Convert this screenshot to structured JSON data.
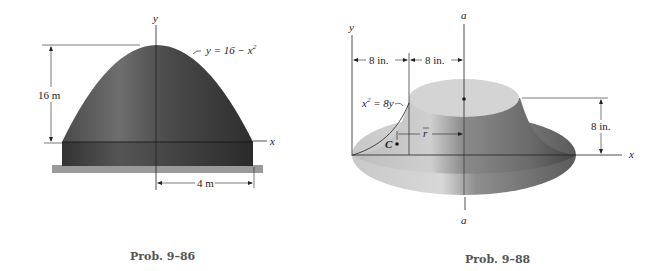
{
  "figures": [
    {
      "id": "prob-9-86",
      "caption": "Prob. 9–86",
      "axes": {
        "x": "x",
        "y": "y"
      },
      "equation_label": "y = 16 − x",
      "equation_exp": "2",
      "height_dim": "16 m",
      "radius_dim": "4 m"
    },
    {
      "id": "prob-9-88",
      "caption": "Prob. 9–88",
      "axes": {
        "x": "x",
        "y": "y",
        "a_top": "a",
        "a_bottom": "a"
      },
      "equation_label_pre": "x",
      "equation_exp": "2",
      "equation_label_post": " = 8y",
      "dim_left": "8 in.",
      "dim_right": "8 in.",
      "height_dim": "8 in.",
      "centroid_label": "C",
      "rbar_label": "r"
    }
  ],
  "colors": {
    "dark_body": "#3a3a3a",
    "mid_body": "#6d6d6d",
    "ground": "#9a9a9a",
    "line": "#222222",
    "caption": "#555555"
  }
}
